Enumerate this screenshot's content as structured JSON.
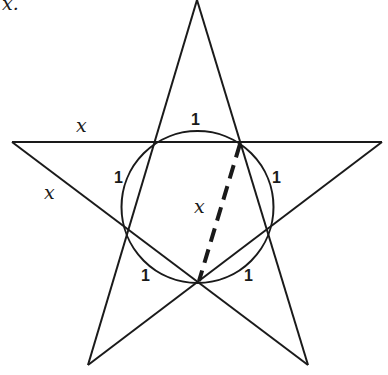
{
  "figure": {
    "caption_fragment": "x.",
    "labels": {
      "top_left_edge": "x",
      "left_edge": "x",
      "arc_top": "1",
      "arc_left": "1",
      "arc_right": "1",
      "arc_bottom_left": "1",
      "arc_bottom_right": "1",
      "diagonal": "x"
    },
    "colors": {
      "stroke": "#1a1a1a",
      "background": "#ffffff"
    }
  }
}
